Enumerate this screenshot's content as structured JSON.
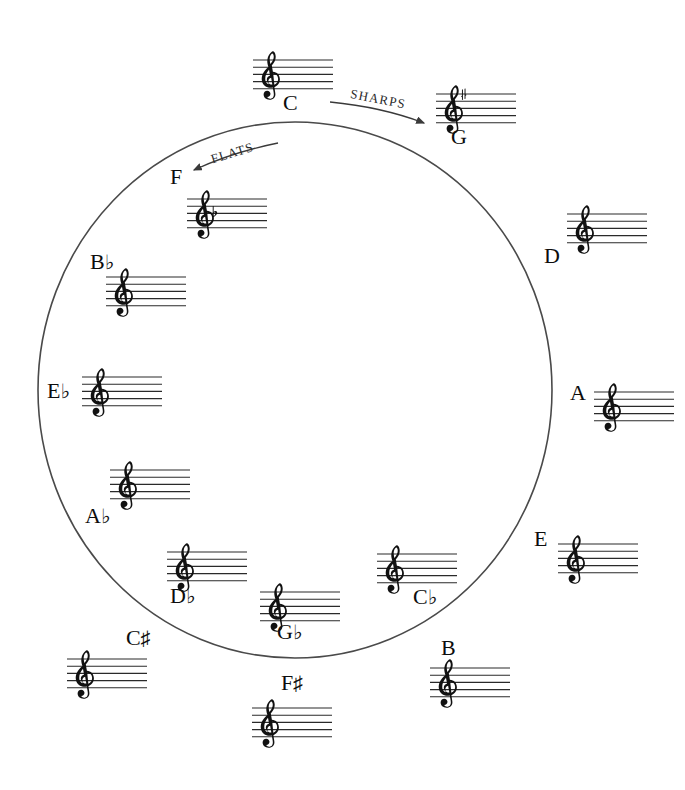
{
  "diagram": {
    "shape": "circle",
    "line_color": "#4a4a4a",
    "text_color": "#0d0d0d",
    "background": "#ffffff",
    "circle": {
      "cx": 295,
      "cy": 390,
      "rx": 257,
      "ry": 268
    }
  },
  "directions": [
    {
      "id": "sharps",
      "label": "SHARPS",
      "arrow_from": {
        "x": 330,
        "y": 102
      },
      "arrow_to": {
        "x": 427,
        "y": 124
      }
    },
    {
      "id": "flats",
      "label": "FLATS",
      "arrow_from": {
        "x": 278,
        "y": 143
      },
      "arrow_to": {
        "x": 191,
        "y": 171
      }
    }
  ],
  "keys": [
    {
      "id": "c-major",
      "label": "C",
      "accidental": "",
      "accidental_count": 0,
      "accidental_type": "none",
      "staff": {
        "x": 251,
        "y": 46,
        "w": 84
      },
      "label_pos": {
        "x": 283,
        "y": 92
      },
      "clef": "treble"
    },
    {
      "id": "g-major",
      "label": "G",
      "accidental": "",
      "accidental_count": 1,
      "accidental_type": "sharp",
      "staff": {
        "x": 434,
        "y": 80,
        "w": 84
      },
      "label_pos": {
        "x": 451,
        "y": 126
      },
      "clef": "treble"
    },
    {
      "id": "d-major",
      "label": "D",
      "accidental": "",
      "accidental_count": 0,
      "accidental_type": "sharp",
      "staff": {
        "x": 565,
        "y": 200,
        "w": 84
      },
      "label_pos": {
        "x": 544,
        "y": 245
      },
      "clef": "treble"
    },
    {
      "id": "a-major",
      "label": "A",
      "accidental": "",
      "accidental_count": 0,
      "accidental_type": "sharp",
      "staff": {
        "x": 592,
        "y": 378,
        "w": 84
      },
      "label_pos": {
        "x": 570,
        "y": 382
      },
      "clef": "treble"
    },
    {
      "id": "e-major",
      "label": "E",
      "accidental": "",
      "accidental_count": 0,
      "accidental_type": "sharp",
      "staff": {
        "x": 556,
        "y": 530,
        "w": 84
      },
      "label_pos": {
        "x": 534,
        "y": 528
      },
      "clef": "treble"
    },
    {
      "id": "b-major",
      "label": "B",
      "accidental": "",
      "accidental_count": 0,
      "accidental_type": "sharp",
      "staff": {
        "x": 428,
        "y": 654,
        "w": 84
      },
      "label_pos": {
        "x": 441,
        "y": 637
      },
      "clef": "treble"
    },
    {
      "id": "f-sharp-major",
      "label": "F",
      "accidental": "♯",
      "accidental_count": 0,
      "accidental_type": "sharp",
      "staff": {
        "x": 250,
        "y": 694,
        "w": 84
      },
      "label_pos": {
        "x": 281,
        "y": 672
      },
      "clef": "treble"
    },
    {
      "id": "c-sharp-major",
      "label": "C",
      "accidental": "♯",
      "accidental_count": 0,
      "accidental_type": "sharp",
      "staff": {
        "x": 65,
        "y": 645,
        "w": 84
      },
      "label_pos": {
        "x": 126,
        "y": 627
      },
      "clef": "treble"
    },
    {
      "id": "g-flat-major",
      "label": "G",
      "accidental": "♭",
      "accidental_count": 0,
      "accidental_type": "flat",
      "staff": {
        "x": 258,
        "y": 578,
        "w": 84
      },
      "label_pos": {
        "x": 277,
        "y": 621
      },
      "clef": "treble"
    },
    {
      "id": "c-flat-major",
      "label": "C",
      "accidental": "♭",
      "accidental_count": 0,
      "accidental_type": "flat",
      "staff": {
        "x": 375,
        "y": 540,
        "w": 84
      },
      "label_pos": {
        "x": 413,
        "y": 586
      },
      "clef": "treble"
    },
    {
      "id": "d-flat-major",
      "label": "D",
      "accidental": "♭",
      "accidental_count": 0,
      "accidental_type": "flat",
      "staff": {
        "x": 165,
        "y": 538,
        "w": 84
      },
      "label_pos": {
        "x": 170,
        "y": 585
      },
      "clef": "treble"
    },
    {
      "id": "a-flat-major",
      "label": "A",
      "accidental": "♭",
      "accidental_count": 0,
      "accidental_type": "flat",
      "staff": {
        "x": 108,
        "y": 456,
        "w": 84
      },
      "label_pos": {
        "x": 85,
        "y": 505
      },
      "clef": "treble"
    },
    {
      "id": "e-flat-major",
      "label": "E",
      "accidental": "♭",
      "accidental_count": 0,
      "accidental_type": "flat",
      "staff": {
        "x": 80,
        "y": 363,
        "w": 84
      },
      "label_pos": {
        "x": 47,
        "y": 380
      },
      "clef": "treble"
    },
    {
      "id": "b-flat-major",
      "label": "B",
      "accidental": "♭",
      "accidental_count": 0,
      "accidental_type": "flat",
      "staff": {
        "x": 104,
        "y": 263,
        "w": 84
      },
      "label_pos": {
        "x": 90,
        "y": 251
      },
      "clef": "treble"
    },
    {
      "id": "f-major",
      "label": "F",
      "accidental": "",
      "accidental_count": 1,
      "accidental_type": "flat",
      "staff": {
        "x": 185,
        "y": 185,
        "w": 84
      },
      "label_pos": {
        "x": 170,
        "y": 166
      },
      "clef": "treble"
    }
  ]
}
